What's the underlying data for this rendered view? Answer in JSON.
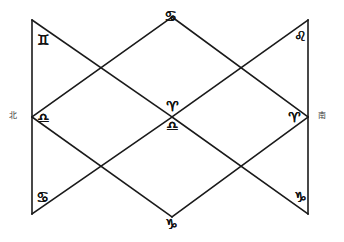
{
  "figure": {
    "stroke_color": "#1a1a1a",
    "background_color": "#ffffff",
    "stroke_width": 1.6
  },
  "directions": {
    "west_label": "北",
    "west_name": "north-marker",
    "east_label": "南",
    "east_name": "south-marker"
  },
  "vertices": [
    {
      "id": "top-left",
      "x": 32,
      "y": 20,
      "glyph": "♊",
      "sign": "gemini",
      "label_x": 37,
      "label_y": 33
    },
    {
      "id": "top-center",
      "x": 172,
      "y": 17,
      "glyph": "♋",
      "sign": "cancer",
      "label_x": 164,
      "label_y": 9
    },
    {
      "id": "top-right",
      "x": 308,
      "y": 20,
      "glyph": "♌",
      "sign": "leo",
      "label_x": 294,
      "label_y": 29
    },
    {
      "id": "mid-left",
      "x": 32,
      "y": 117,
      "glyph": "♎",
      "sign": "libra",
      "label_x": 37,
      "label_y": 111
    },
    {
      "id": "center-upper",
      "x": 172,
      "y": 117,
      "glyph": "♈",
      "sign": "aries",
      "label_x": 166,
      "label_y": 99
    },
    {
      "id": "center-lower",
      "x": 172,
      "y": 117,
      "glyph": "♎",
      "sign": "libra",
      "label_x": 166,
      "label_y": 119
    },
    {
      "id": "mid-right",
      "x": 308,
      "y": 117,
      "glyph": "♈",
      "sign": "aries",
      "label_x": 288,
      "label_y": 110
    },
    {
      "id": "bottom-left",
      "x": 32,
      "y": 214,
      "glyph": "♋",
      "sign": "cancer",
      "label_x": 36,
      "label_y": 190
    },
    {
      "id": "bottom-center",
      "x": 172,
      "y": 217,
      "glyph": "♑",
      "sign": "capricorn",
      "label_x": 165,
      "label_y": 217
    },
    {
      "id": "bottom-right",
      "x": 308,
      "y": 214,
      "glyph": "♑",
      "sign": "capricorn",
      "label_x": 294,
      "label_y": 190
    }
  ],
  "segments": [
    {
      "name": "left-vertical",
      "x1": 32,
      "y1": 20,
      "x2": 32,
      "y2": 214
    },
    {
      "name": "right-vertical",
      "x1": 308,
      "y1": 20,
      "x2": 308,
      "y2": 214
    },
    {
      "name": "upper-left-descending",
      "x1": 32,
      "y1": 20,
      "x2": 172,
      "y2": 117
    },
    {
      "name": "upper-left-ascending",
      "x1": 32,
      "y1": 117,
      "x2": 172,
      "y2": 17
    },
    {
      "name": "upper-right-ascending",
      "x1": 172,
      "y1": 17,
      "x2": 308,
      "y2": 117
    },
    {
      "name": "upper-right-descending",
      "x1": 172,
      "y1": 117,
      "x2": 308,
      "y2": 20
    },
    {
      "name": "lower-left-descending",
      "x1": 32,
      "y1": 117,
      "x2": 172,
      "y2": 217
    },
    {
      "name": "lower-left-ascending",
      "x1": 32,
      "y1": 214,
      "x2": 172,
      "y2": 117
    },
    {
      "name": "lower-right-ascending",
      "x1": 172,
      "y1": 217,
      "x2": 308,
      "y2": 117
    },
    {
      "name": "lower-right-descending",
      "x1": 172,
      "y1": 117,
      "x2": 308,
      "y2": 214
    }
  ]
}
